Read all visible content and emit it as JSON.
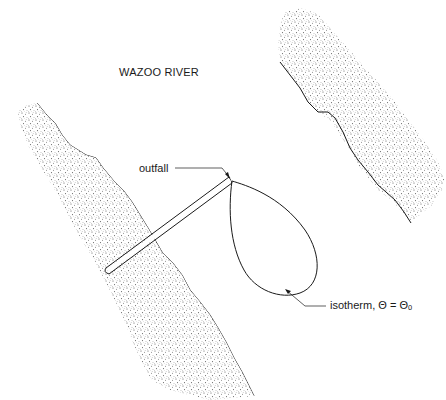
{
  "diagram": {
    "title": "WAZOO RIVER",
    "labels": {
      "outfall": "outfall",
      "isotherm": "isotherm, Θ = Θₒ"
    },
    "elements": [
      {
        "name": "left-river-bank",
        "type": "stippled-land"
      },
      {
        "name": "right-river-bank",
        "type": "stippled-land"
      },
      {
        "name": "outfall-pipe",
        "type": "double-line-pipe"
      },
      {
        "name": "thermal-plume",
        "type": "teardrop-isotherm-outline"
      }
    ],
    "colors": {
      "ink": "#1a1a1a",
      "stipple": "#6e6e6e",
      "background": "#ffffff"
    }
  }
}
